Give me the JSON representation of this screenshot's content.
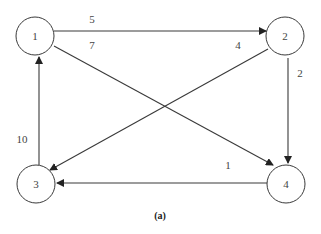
{
  "diagram": {
    "type": "directed-weighted-graph",
    "caption": "(a)",
    "nodes": [
      {
        "id": "1",
        "label": "1",
        "cx": 35,
        "cy": 36,
        "r": 19
      },
      {
        "id": "2",
        "label": "2",
        "cx": 285,
        "cy": 36,
        "r": 19
      },
      {
        "id": "3",
        "label": "3",
        "cx": 36,
        "cy": 184,
        "r": 19
      },
      {
        "id": "4",
        "label": "4",
        "cx": 286,
        "cy": 184,
        "r": 19
      }
    ],
    "edges": [
      {
        "from": "1",
        "to": "2",
        "weight": "5",
        "x1": 54,
        "y1": 31,
        "x2": 266,
        "y2": 31,
        "lx": 92,
        "ly": 19
      },
      {
        "from": "1",
        "to": "4",
        "weight": "7",
        "x1": 54,
        "y1": 46,
        "x2": 273,
        "y2": 165,
        "lx": 92,
        "ly": 45
      },
      {
        "from": "2",
        "to": "3",
        "weight": "4",
        "x1": 268,
        "y1": 49,
        "x2": 50,
        "y2": 170,
        "lx": 238,
        "ly": 45
      },
      {
        "from": "2",
        "to": "4",
        "weight": "2",
        "x1": 288,
        "y1": 58,
        "x2": 288,
        "y2": 163,
        "lx": 300,
        "ly": 73
      },
      {
        "from": "3",
        "to": "1",
        "weight": "10",
        "x1": 39,
        "y1": 165,
        "x2": 39,
        "y2": 57,
        "lx": 22,
        "ly": 139
      },
      {
        "from": "4",
        "to": "3",
        "weight": "1",
        "x1": 267,
        "y1": 183,
        "x2": 57,
        "y2": 183,
        "lx": 228,
        "ly": 165
      }
    ]
  }
}
